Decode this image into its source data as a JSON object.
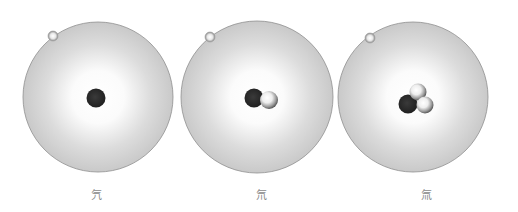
{
  "colors": {
    "cloud_edge": "#c8c8c8",
    "cloud_center": "#ffffff",
    "cloud_border": "#8f8f8f",
    "proton": "#2a2a2a",
    "neutron_light": "#ffffff",
    "neutron_dark": "#6e6e6e",
    "electron": "#b5b5b5"
  },
  "atoms": [
    {
      "label": "氕",
      "protons": 1,
      "neutrons": 0,
      "electrons": 1
    },
    {
      "label": "氘",
      "protons": 1,
      "neutrons": 1,
      "electrons": 1
    },
    {
      "label": "氚",
      "protons": 1,
      "neutrons": 2,
      "electrons": 1
    }
  ]
}
